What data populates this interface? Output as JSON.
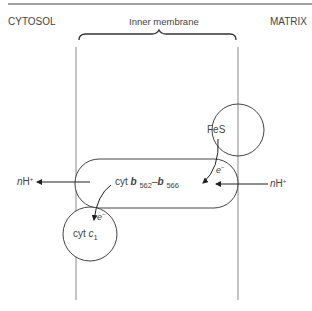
{
  "labels": {
    "cytosol": "CYTOSOL",
    "membrane": "Inner membrane",
    "matrix": "MATRIX",
    "fes": "FeS",
    "cytb_prefix": "cyt ",
    "cytb_b1": "b",
    "cytb_sub1": "562",
    "cytb_dash": "–",
    "cytb_b2": "b",
    "cytb_sub2": "566",
    "cytc_prefix": "cyt ",
    "cytc_c": "c",
    "cytc_sub": "1",
    "nh_left_n": "n",
    "nh_left_h": "H",
    "nh_left_sup": "+",
    "nh_right_n": "n",
    "nh_right_h": "H",
    "nh_right_sup": "+",
    "e1": "e",
    "e1_sup": "−",
    "e2": "e",
    "e2_sup": "−"
  }
}
